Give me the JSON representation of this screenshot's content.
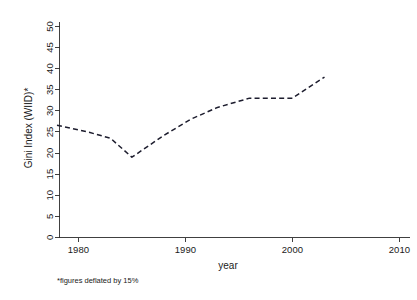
{
  "chart_data": {
    "type": "line",
    "title": "",
    "xlabel": "year",
    "ylabel": "Gini Index (WIID)*",
    "footnote": "*figures deflated by 15%",
    "grid": false,
    "legend": null,
    "xlim": [
      1977,
      2011
    ],
    "ylim": [
      0,
      52
    ],
    "xticks": [
      1980,
      1990,
      2000,
      2010
    ],
    "xtick_labels": [
      "1980",
      "1990",
      "2000",
      "2010"
    ],
    "yticks": [
      0,
      5,
      10,
      15,
      20,
      25,
      30,
      35,
      40,
      45,
      50
    ],
    "ytick_labels": [
      "0",
      "5",
      "10",
      "15",
      "20",
      "25",
      "30",
      "35",
      "40",
      "45",
      "50"
    ],
    "line_style": "dashed",
    "line_color": "#1d1d2e",
    "series": [
      {
        "name": "Gini Index (WIID)",
        "x": [
          1978.0,
          1981.0,
          1983.0,
          1985.0,
          1988.0,
          1990.5,
          1993.0,
          1996.0,
          2000.0,
          2003.0
        ],
        "values": [
          26.6,
          24.9,
          23.5,
          19.0,
          24.2,
          28.0,
          30.8,
          33.0,
          33.0,
          38.0
        ]
      }
    ]
  },
  "axis": {
    "x_title": "year",
    "y_title": "Gini Index (WIID)*"
  },
  "notes": {
    "footnote": "*figures deflated by 15%"
  }
}
